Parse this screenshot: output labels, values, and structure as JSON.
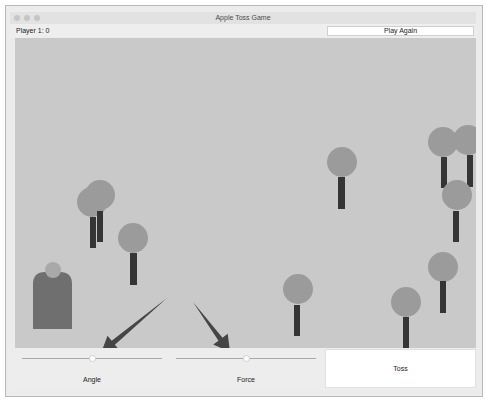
{
  "window": {
    "title": "Apple Toss Game",
    "traffic_lights": [
      "close-button",
      "minimize-button",
      "zoom-button"
    ]
  },
  "header": {
    "score_label": "Player 1: 0",
    "play_again_label": "Play Again"
  },
  "colors": {
    "canvas_bg": "#c9c9c9",
    "tree_crown": "#9b9b9b",
    "tree_trunk": "#353535",
    "player_body": "#6f6f6f",
    "player_head": "#a9a9a9",
    "arrow": "#454545"
  },
  "scene": {
    "player": {
      "body": {
        "x": 33,
        "y": 272,
        "w": 39,
        "h": 57
      },
      "head": {
        "cx": 53,
        "cy": 270,
        "r": 8
      }
    },
    "trees": [
      {
        "cx": 92,
        "cy": 202,
        "r": 15,
        "trunk": {
          "x": 90,
          "y": 217,
          "w": 6,
          "h": 31
        }
      },
      {
        "cx": 100,
        "cy": 195,
        "r": 15,
        "trunk": {
          "x": 97,
          "y": 211,
          "w": 6,
          "h": 31
        }
      },
      {
        "cx": 133,
        "cy": 238,
        "r": 15,
        "trunk": {
          "x": 130,
          "y": 253,
          "w": 7,
          "h": 32
        }
      },
      {
        "cx": 342,
        "cy": 162,
        "r": 15,
        "trunk": {
          "x": 338,
          "y": 177,
          "w": 7,
          "h": 32
        }
      },
      {
        "cx": 443,
        "cy": 142,
        "r": 15,
        "trunk": {
          "x": 441,
          "y": 157,
          "w": 6,
          "h": 31
        }
      },
      {
        "cx": 468,
        "cy": 140,
        "r": 15,
        "trunk": {
          "x": 467,
          "y": 155,
          "w": 6,
          "h": 32
        }
      },
      {
        "cx": 457,
        "cy": 195,
        "r": 15,
        "trunk": {
          "x": 453,
          "y": 211,
          "w": 6,
          "h": 31
        }
      },
      {
        "cx": 298,
        "cy": 289,
        "r": 15,
        "trunk": {
          "x": 294,
          "y": 305,
          "w": 6,
          "h": 31
        }
      },
      {
        "cx": 443,
        "cy": 267,
        "r": 15,
        "trunk": {
          "x": 440,
          "y": 281,
          "w": 6,
          "h": 32
        }
      },
      {
        "cx": 406,
        "cy": 302,
        "r": 15,
        "trunk": {
          "x": 403,
          "y": 317,
          "w": 6,
          "h": 31
        }
      }
    ],
    "arrows": [
      {
        "name": "angle-arrow",
        "x1": 167,
        "y1": 298,
        "x2": 101,
        "y2": 353
      },
      {
        "name": "force-arrow",
        "x1": 193,
        "y1": 302,
        "x2": 230,
        "y2": 352
      }
    ]
  },
  "controls": {
    "angle": {
      "label": "Angle",
      "track_x1": 22,
      "track_x2": 162,
      "thumb_x": 92
    },
    "force": {
      "label": "Force",
      "track_x1": 176,
      "track_x2": 316,
      "thumb_x": 246
    },
    "toss_label": "Toss"
  }
}
